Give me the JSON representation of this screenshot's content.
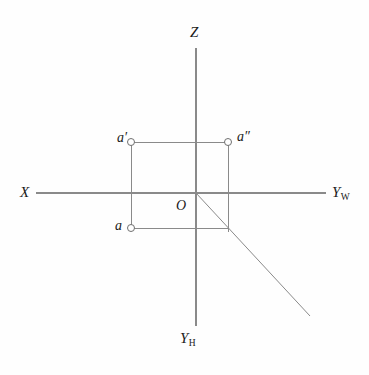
{
  "figure": {
    "type": "descriptive-geometry-diagram",
    "width": 369,
    "height": 375,
    "background_color": "#fefefe",
    "line_color": "#8a8a8a",
    "text_color": "#1a1a1a",
    "marker_fill": "#ffffff"
  },
  "axes": [
    {
      "id": "z",
      "label": "Z",
      "subscript": "",
      "orientation": "vertical-up",
      "from": [
        196,
        193
      ],
      "to": [
        196,
        48
      ],
      "label_position": [
        190,
        25
      ]
    },
    {
      "id": "x",
      "label": "X",
      "subscript": "",
      "orientation": "horizontal-left",
      "from": [
        196,
        193
      ],
      "to": [
        36,
        193
      ],
      "label_position": [
        20,
        185
      ]
    },
    {
      "id": "yw",
      "label": "Y",
      "subscript": "W",
      "orientation": "horizontal-right",
      "from": [
        196,
        193
      ],
      "to": [
        326,
        193
      ],
      "label_position": [
        332,
        185
      ]
    },
    {
      "id": "yh",
      "label": "Y",
      "subscript": "H",
      "orientation": "vertical-down",
      "from": [
        196,
        193
      ],
      "to": [
        196,
        326
      ],
      "label_position": [
        180,
        331
      ]
    }
  ],
  "origin": {
    "label": "O",
    "position": [
      196,
      193
    ],
    "label_position": [
      176,
      199
    ]
  },
  "points": [
    {
      "id": "a-prime",
      "label": "a′",
      "position": [
        131,
        142
      ],
      "label_position": [
        117,
        131
      ],
      "marker": "open-circle",
      "radius": 3.5
    },
    {
      "id": "a-double-prime",
      "label": "a″",
      "position": [
        228,
        142
      ],
      "label_position": [
        237,
        130
      ],
      "marker": "open-circle",
      "radius": 3.5
    },
    {
      "id": "a",
      "label": "a",
      "position": [
        131,
        228
      ],
      "label_position": [
        115,
        219
      ],
      "marker": "open-circle",
      "radius": 3.5
    }
  ],
  "construction_lines": [
    {
      "id": "top-edge",
      "from": [
        131,
        142
      ],
      "to": [
        228,
        142
      ]
    },
    {
      "id": "left-edge",
      "from": [
        131,
        142
      ],
      "to": [
        131,
        228
      ]
    },
    {
      "id": "right-edge",
      "from": [
        228,
        142
      ],
      "to": [
        228,
        232
      ]
    },
    {
      "id": "bottom-edge",
      "from": [
        131,
        228
      ],
      "to": [
        228,
        228
      ]
    },
    {
      "id": "bisector-diagonal",
      "from": [
        196,
        193
      ],
      "to": [
        310,
        316
      ]
    }
  ]
}
